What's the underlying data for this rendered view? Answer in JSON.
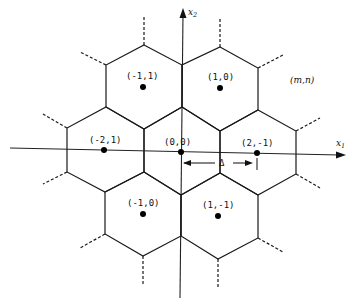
{
  "figure": {
    "type": "hexagonal lattice with Voronoi cells",
    "axes": {
      "x1_label": "x",
      "x1_sub": "1",
      "x2_label": "x",
      "x2_sub": "2"
    },
    "points": [
      {
        "label": "(-1,1)",
        "x": 143,
        "y": 87
      },
      {
        "label": "(1,0)",
        "x": 220,
        "y": 88
      },
      {
        "label": "(-2,1)",
        "x": 104,
        "y": 150
      },
      {
        "label": "(0,0)",
        "x": 181,
        "y": 152
      },
      {
        "label": "(2,-1)",
        "x": 257,
        "y": 153
      },
      {
        "label": "(-1,0)",
        "x": 143,
        "y": 214
      },
      {
        "label": "(1,-1)",
        "x": 218,
        "y": 216
      }
    ],
    "generic_label": "(m,n)",
    "spacing_label": "Δ",
    "colors": {
      "ink": "#1a1a1a",
      "background": "#ffffff"
    }
  }
}
